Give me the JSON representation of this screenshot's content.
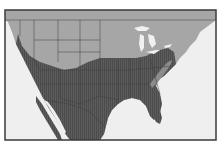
{
  "map": {
    "type": "regional shaded map",
    "region": "North America (United States, southern Canada, northern Mexico)",
    "colors": {
      "page_background": "#ffffff",
      "water": "#efefef",
      "frame": "#3a3a3a",
      "zone_light": "#a6a6a6",
      "zone_dark": "#5c5c5c",
      "zone_dark_hatch": "#4a4a4a",
      "zone_mid_ridge": "#8c8c8c",
      "borders": "#3c3c3c",
      "lakes": "#f0f0f0"
    },
    "zones": [
      {
        "name": "northern-zone",
        "shade": "light gray",
        "covers": "Canada and northern US states"
      },
      {
        "name": "southern-zone",
        "shade": "dark hatched gray",
        "covers": "southern and central US and northern Mexico"
      },
      {
        "name": "appalachian-ridge",
        "shade": "medium gray",
        "covers": "Appalachian highlands"
      }
    ],
    "features": [
      "Great Lakes",
      "Florida peninsula",
      "Gulf of California",
      "Baja California",
      "Gulf of Mexico",
      "Atlantic coast",
      "Pacific coast"
    ]
  }
}
